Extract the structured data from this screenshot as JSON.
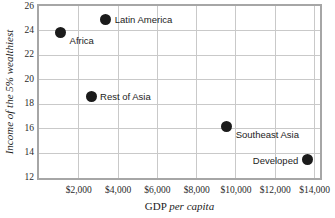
{
  "chart_data": {
    "type": "scatter",
    "title": "",
    "xlabel": "GDP per capita",
    "ylabel": "Income of the 5% wealthiest",
    "xlim": [
      0,
      14250
    ],
    "ylim": [
      12,
      26
    ],
    "grid": true,
    "legend": "none (points labelled directly)",
    "xticks": [
      "$2,000",
      "$4,000",
      "$6,000",
      "$8,000",
      "$10,000",
      "$12,000",
      "$14,000"
    ],
    "xtick_values": [
      2000,
      4000,
      6000,
      8000,
      10000,
      12000,
      14000
    ],
    "yticks": [
      "12",
      "14",
      "16",
      "18",
      "20",
      "22",
      "24",
      "26"
    ],
    "ytick_values": [
      12,
      14,
      16,
      18,
      20,
      22,
      24,
      26
    ],
    "points": [
      {
        "label": "Africa",
        "x": 1100,
        "y": 23.8,
        "label_side": "right"
      },
      {
        "label": "Latin America",
        "x": 3400,
        "y": 24.9,
        "label_side": "right"
      },
      {
        "label": "Rest of Asia",
        "x": 2650,
        "y": 18.6,
        "label_side": "right"
      },
      {
        "label": "Southeast Asia",
        "x": 9550,
        "y": 16.1,
        "label_side": "right"
      },
      {
        "label": "Developed",
        "x": 13650,
        "y": 13.4,
        "label_side": "left"
      }
    ],
    "marker_color": "#1b1b1b",
    "grid_color": "#c9c9c9",
    "frame_color": "#a6a6a6",
    "background_color": "#ffffff"
  }
}
